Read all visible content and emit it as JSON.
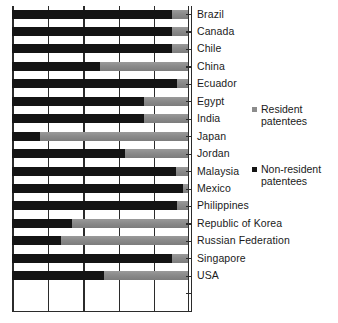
{
  "chart_data": {
    "type": "bar",
    "subtype": "stacked-horizontal-100pct",
    "title": "",
    "subtitle": "",
    "xlabel": "",
    "ylabel": "",
    "xlim": [
      0,
      100
    ],
    "xticks": [
      0,
      20,
      40,
      60,
      80,
      100
    ],
    "xtick_labels": [
      "",
      "",
      "",
      "",
      "",
      ""
    ],
    "grid": true,
    "grid_axis": "x",
    "legend_position": "right",
    "categories": [
      "Brazil",
      "Canada",
      "Chile",
      "China",
      "Ecuador",
      "Egypt",
      "India",
      "Japan",
      "Jordan",
      "Malaysia",
      "Mexico",
      "Philippines",
      "Republic of Korea",
      "Russian Federation",
      "Singapore",
      "USA"
    ],
    "series": [
      {
        "name": "Non-resident patentees",
        "color": "#141414",
        "values": [
          91,
          91,
          91,
          50,
          94,
          75,
          75,
          16,
          64,
          93,
          97,
          94,
          34,
          28,
          91,
          52
        ]
      },
      {
        "name": "Resident patentees",
        "color": "#8c8c8c",
        "values": [
          9,
          9,
          9,
          50,
          6,
          25,
          25,
          84,
          36,
          7,
          3,
          6,
          66,
          72,
          9,
          48
        ]
      }
    ]
  },
  "legend": {
    "entries": [
      {
        "label": "Resident\npatentees",
        "swatch": "resident-swatch"
      },
      {
        "label": "Non-resident\npatentees",
        "swatch": "nonresident-swatch"
      }
    ]
  }
}
